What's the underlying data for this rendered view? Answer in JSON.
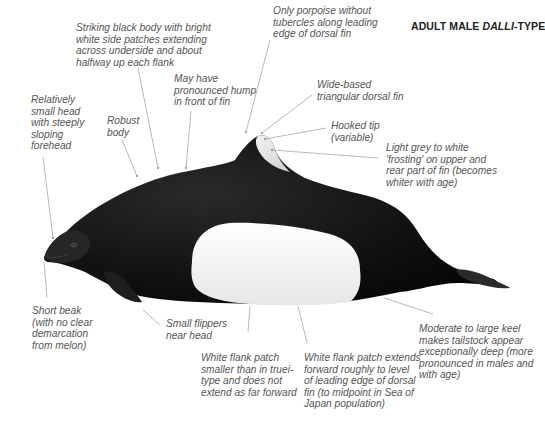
{
  "title": {
    "prefix": "ADULT MALE ",
    "italic": "DALLI",
    "suffix": "-TYPE"
  },
  "annotations": {
    "body_colour": "Striking black body with bright\nwhite side patches extending\nacross underside and about\nhalfway up each flank",
    "hump": "May have\npronounced hump\nin front of fin",
    "head": "Relatively\nsmall head\nwith steeply\nsloping\nforehead",
    "robust": "Robust\nbody",
    "tubercles": "Only porpoise without\ntubercles along leading\nedge of dorsal fin",
    "dorsal_fin": "Wide-based\ntriangular dorsal fin",
    "hooked_tip": "Hooked tip\n(variable)",
    "frosting": "Light grey to white\n'frosting' on upper and\nrear part of fin (becomes\nwhiter with age)",
    "beak": "Short beak\n(with no clear\ndemarcation\nfrom melon)",
    "flippers": "Small flippers\nnear head",
    "flank_smaller": "White flank patch\nsmaller than in truei-\ntype and does not\nextend as far forward",
    "flank_extends": "White flank patch extends\nforward roughly to level\nof leading edge of dorsal\nfin (to midpoint in Sea of\nJapan population)",
    "keel": "Moderate to large keel\nmakes tailstock appear\nexceptionally deep (more\npronounced in males and\nwith age)"
  },
  "colors": {
    "body": "#111111",
    "patch": "#f4f4f4",
    "leader": "#9a9a9a",
    "label_text": "#555555"
  }
}
